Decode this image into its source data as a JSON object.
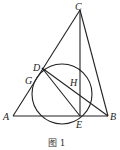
{
  "figure": {
    "caption": "图 1",
    "points": {
      "A": {
        "label": "A",
        "x": 13,
        "y": 116
      },
      "B": {
        "label": "B",
        "x": 108,
        "y": 116
      },
      "C": {
        "label": "C",
        "x": 80,
        "y": 10
      },
      "D": {
        "label": "D",
        "x": 42,
        "y": 68
      },
      "E": {
        "label": "E",
        "x": 80,
        "y": 116
      },
      "G": {
        "label": "G",
        "x": 35,
        "y": 79
      },
      "H": {
        "label": "H",
        "x": 74,
        "y": 84
      }
    },
    "segments": [
      "AB",
      "AC",
      "BC",
      "CE",
      "DE",
      "DB"
    ],
    "circle": {
      "cx": 62,
      "cy": 94,
      "r": 30
    },
    "stroke_color": "#222222"
  }
}
